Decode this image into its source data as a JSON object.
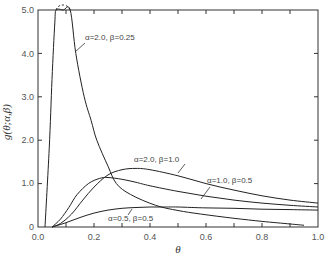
{
  "chart_data": {
    "type": "line",
    "title": "",
    "xlabel": "θ",
    "ylabel": "g(θ; α, β)",
    "xlim": [
      0.0,
      1.0
    ],
    "ylim": [
      0.0,
      5.0
    ],
    "grid": false,
    "x_ticks": [
      "0.0",
      "0.2",
      "0.4",
      "0.6",
      "0.8",
      "1.0"
    ],
    "y_ticks": [
      "0",
      "1.0",
      "2.0",
      "3.0",
      "4.0",
      "5.0"
    ],
    "series": [
      {
        "name": "α = 2.0, β = 0.25",
        "clipped_above": 5.0,
        "x": [
          0.025,
          0.04,
          0.05,
          0.06,
          0.065,
          0.09,
          0.115,
          0.135,
          0.165,
          0.19,
          0.21,
          0.25,
          0.28,
          0.33,
          0.42,
          0.5,
          0.58,
          0.7,
          0.8,
          0.9,
          0.95
        ],
        "y": [
          0.0,
          1.8,
          3.4,
          4.7,
          5.0,
          5.0,
          5.0,
          4.0,
          3.0,
          2.45,
          2.0,
          1.4,
          1.0,
          0.75,
          0.5,
          0.38,
          0.3,
          0.2,
          0.13,
          0.07,
          0.04
        ]
      },
      {
        "name": "α = 2.0, β = 1.0",
        "x": [
          0.05,
          0.08,
          0.12,
          0.16,
          0.2,
          0.25,
          0.3,
          0.35,
          0.4,
          0.5,
          0.6,
          0.7,
          0.8,
          0.9,
          1.0
        ],
        "y": [
          0.0,
          0.08,
          0.3,
          0.62,
          0.92,
          1.2,
          1.32,
          1.35,
          1.32,
          1.18,
          1.0,
          0.85,
          0.72,
          0.62,
          0.55
        ]
      },
      {
        "name": "α = 1.0, β = 0.5",
        "x": [
          0.05,
          0.08,
          0.11,
          0.14,
          0.18,
          0.22,
          0.25,
          0.3,
          0.35,
          0.4,
          0.5,
          0.6,
          0.7,
          0.8,
          0.9,
          1.0
        ],
        "y": [
          0.0,
          0.18,
          0.45,
          0.75,
          1.0,
          1.12,
          1.14,
          1.1,
          1.03,
          0.95,
          0.82,
          0.71,
          0.62,
          0.55,
          0.5,
          0.46
        ]
      },
      {
        "name": "α = 0.5, β = 0.5",
        "x": [
          0.05,
          0.1,
          0.15,
          0.2,
          0.25,
          0.3,
          0.35,
          0.4,
          0.45,
          0.5,
          0.6,
          0.7,
          0.8,
          0.9,
          1.0
        ],
        "y": [
          0.0,
          0.1,
          0.22,
          0.32,
          0.39,
          0.43,
          0.45,
          0.46,
          0.46,
          0.46,
          0.44,
          0.43,
          0.41,
          0.4,
          0.39
        ]
      }
    ],
    "annotations": [
      {
        "text": "α = 2.0, β = 0.25",
        "series": 0
      },
      {
        "text": "α = 2.0, β = 1.0",
        "series": 1
      },
      {
        "text": "α = 1.0, β = 0.5",
        "series": 2
      },
      {
        "text": "α = 0.5, β = 0.5",
        "series": 3
      }
    ]
  },
  "labels": {
    "xlabel": "θ",
    "ylabel": "g(θ;α,β)",
    "anno_a2_b025": "α=2.0, β=0.25",
    "anno_a2_b1": "α=2.0, β=1.0",
    "anno_a1_b05": "α=1.0, β=0.5",
    "anno_a05_b05": "α=0.5, β=0.5",
    "xticks": [
      "0.0",
      "0.2",
      "0.4",
      "0.6",
      "0.8",
      "1.0"
    ],
    "yticks": [
      "0",
      "1.0",
      "2.0",
      "3.0",
      "4.0",
      "5.0"
    ]
  }
}
